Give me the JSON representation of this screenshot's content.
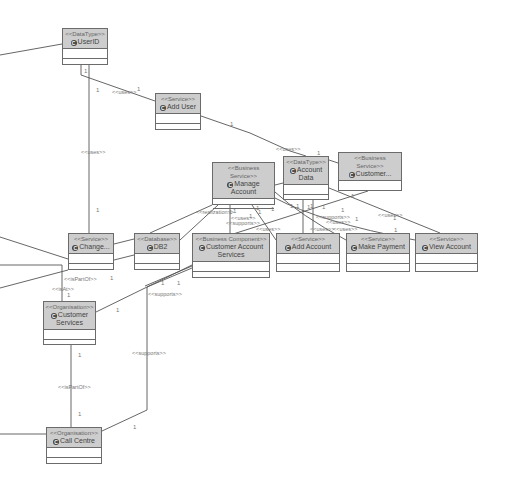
{
  "diagram": {
    "type": "UML class diagram",
    "colors": {
      "header_fill": "#cdcdcd",
      "border": "#6b6b6b",
      "line": "#555555",
      "label": "#777777"
    },
    "class_icon": "C",
    "nodes": [
      {
        "id": "userid",
        "stereotype": "<<DataType>>",
        "name": "UserID"
      },
      {
        "id": "adduser",
        "stereotype": "<<Service>>",
        "name": "Add User"
      },
      {
        "id": "manageaccount",
        "stereotype": "<<Business Service>>",
        "name": "Manage Account"
      },
      {
        "id": "accountdata",
        "stereotype": "<<DataType>>",
        "name": "Account Data"
      },
      {
        "id": "customer",
        "stereotype": "<<Business Service>>",
        "name": "Customer..."
      },
      {
        "id": "change",
        "stereotype": "<<Service>>",
        "name": "Change..."
      },
      {
        "id": "db2",
        "stereotype": "<<Database>>",
        "name": "DB2"
      },
      {
        "id": "cas",
        "stereotype": "<<Business Component>>",
        "name": "Customer Account Services"
      },
      {
        "id": "addaccount",
        "stereotype": "<<Service>>",
        "name": "Add Account"
      },
      {
        "id": "makepayment",
        "stereotype": "<<Service>>",
        "name": "Make Payment"
      },
      {
        "id": "viewaccount",
        "stereotype": "<<Service>>",
        "name": "View Account"
      },
      {
        "id": "custservices",
        "stereotype": "<<Organisation>>",
        "name": "Customer Services"
      },
      {
        "id": "callcentre",
        "stereotype": "<<Organisation>>",
        "name": "Call Centre"
      }
    ],
    "edge_labels": [
      {
        "text": "<<uses>>",
        "x": 112,
        "y": 89
      },
      {
        "text": "<<uses>>",
        "x": 81,
        "y": 149
      },
      {
        "text": "<<uses>>",
        "x": 276,
        "y": 146
      },
      {
        "text": "<<realization>>",
        "x": 196,
        "y": 209
      },
      {
        "text": "<<uses>>",
        "x": 231,
        "y": 215
      },
      {
        "text": "<<supports>>",
        "x": 226,
        "y": 220
      },
      {
        "text": "<<uses>>",
        "x": 256,
        "y": 226
      },
      {
        "text": "<<supports>>",
        "x": 316,
        "y": 214
      },
      {
        "text": "<<uses>>",
        "x": 326,
        "y": 219
      },
      {
        "text": "<<uses>>",
        "x": 310,
        "y": 226
      },
      {
        "text": "<<uses>>",
        "x": 333,
        "y": 226
      },
      {
        "text": "<<uses>>",
        "x": 378,
        "y": 212
      },
      {
        "text": "<<isPartOf>>",
        "x": 64,
        "y": 276
      },
      {
        "text": "<<isAt>>",
        "x": 52,
        "y": 286
      },
      {
        "text": "<<supports>>",
        "x": 148,
        "y": 291
      },
      {
        "text": "<<supports>>",
        "x": 132,
        "y": 350
      },
      {
        "text": "<<isPartOf>>",
        "x": 58,
        "y": 384
      }
    ],
    "multiplicities": [
      {
        "text": "1",
        "x": 84,
        "y": 68
      },
      {
        "text": "1",
        "x": 96,
        "y": 87
      },
      {
        "text": "1",
        "x": 137,
        "y": 86
      },
      {
        "text": "1",
        "x": 230,
        "y": 121
      },
      {
        "text": "1",
        "x": 317,
        "y": 150
      },
      {
        "text": "1",
        "x": 96,
        "y": 207
      },
      {
        "text": "1",
        "x": 229,
        "y": 209
      },
      {
        "text": "1",
        "x": 233,
        "y": 208
      },
      {
        "text": "1",
        "x": 249,
        "y": 213
      },
      {
        "text": "1",
        "x": 256,
        "y": 205
      },
      {
        "text": "1",
        "x": 258,
        "y": 209
      },
      {
        "text": "1",
        "x": 271,
        "y": 206
      },
      {
        "text": "1",
        "x": 290,
        "y": 203
      },
      {
        "text": "1",
        "x": 296,
        "y": 203
      },
      {
        "text": "1",
        "x": 307,
        "y": 204
      },
      {
        "text": "1",
        "x": 310,
        "y": 203
      },
      {
        "text": "1",
        "x": 322,
        "y": 204
      },
      {
        "text": "1",
        "x": 341,
        "y": 207
      },
      {
        "text": "1",
        "x": 351,
        "y": 193
      },
      {
        "text": "1",
        "x": 355,
        "y": 216
      },
      {
        "text": "1",
        "x": 393,
        "y": 215
      },
      {
        "text": "1",
        "x": 394,
        "y": 227
      },
      {
        "text": "1",
        "x": 110,
        "y": 275
      },
      {
        "text": "1",
        "x": 67,
        "y": 292
      },
      {
        "text": "1",
        "x": 161,
        "y": 280
      },
      {
        "text": "1",
        "x": 177,
        "y": 280
      },
      {
        "text": "1",
        "x": 116,
        "y": 307
      },
      {
        "text": "1",
        "x": 78,
        "y": 352
      },
      {
        "text": "1",
        "x": 78,
        "y": 411
      },
      {
        "text": "1",
        "x": 133,
        "y": 424
      }
    ]
  }
}
